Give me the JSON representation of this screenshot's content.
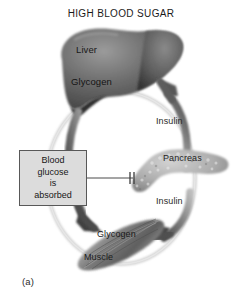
{
  "figure": {
    "title": "HIGH BLOOD SUGAR",
    "caption": "(a)",
    "background_color": "#ffffff"
  },
  "organs": {
    "liver": {
      "name": "Liver",
      "label": "Liver",
      "stored_substance_label": "Glycogen",
      "color": "#6f6f6f"
    },
    "pancreas": {
      "name": "Pancreas",
      "label": "Pancreas",
      "color": "#a9a9a9"
    },
    "muscle": {
      "name": "Muscle",
      "label": "Muscle",
      "stored_substance_label": "Glycogen",
      "color": "#8a8a8a"
    }
  },
  "annotations": {
    "blood_glucose_box": {
      "lines": [
        "Blood",
        "glucose",
        "is",
        "absorbed"
      ],
      "fill_color": "#dcdcdc",
      "border_color": "#585858"
    },
    "insulin_to_liver": "Insulin",
    "insulin_to_muscle": "Insulin"
  },
  "bloodstream": {
    "label": "bloodstream-ring",
    "color": "#d6d6d6"
  }
}
